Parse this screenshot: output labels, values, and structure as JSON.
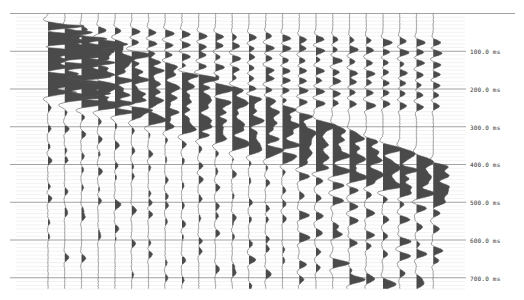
{
  "chart_data": {
    "type": "seismic-wiggle-trace",
    "title": "",
    "xlabel": "",
    "ylabel": "Time (ms)",
    "trace_count": 24,
    "time_axis": {
      "unit": "ms",
      "ticks": [
        100,
        200,
        300,
        400,
        500,
        600,
        700
      ],
      "tick_labels": [
        "100.0 ms",
        "200.0 ms",
        "300.0 ms",
        "400.0 ms",
        "500.0 ms",
        "600.0 ms",
        "700.0 ms"
      ],
      "range": [
        0,
        735
      ],
      "grid": true,
      "minor_grid_step_ms": 10
    },
    "fill": "positive lobes filled (variable area wiggle)",
    "moveout": {
      "description": "Strong linear event dipping from upper-left (~30 ms at trace 1) to lower-right (~420 ms at trace 24); high-amplitude energy concentrated in traces 1-8 between 30-230 ms",
      "first_break_ms_trace1": 30,
      "first_break_ms_trace24": 400
    }
  },
  "colors": {
    "background": "#ffffff",
    "wiggle": "#555555",
    "fill": "#4a4a4a",
    "major_grid": "#8a8a8a",
    "minor_grid": "#e4e4e4",
    "label": "#333333"
  },
  "labels": {
    "t100": "100.0 ms",
    "t200": "200.0 ms",
    "t300": "300.0 ms",
    "t400": "400.0 ms",
    "t500": "500.0 ms",
    "t600": "600.0 ms",
    "t700": "700.0 ms"
  }
}
